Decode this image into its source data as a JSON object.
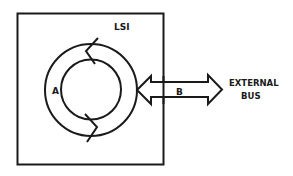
{
  "diagram": {
    "chip_label": "LSI",
    "ring_label": "A",
    "bus_arrow_label": "B",
    "external_label_line1": "EXTERNAL",
    "external_label_line2": "BUS",
    "colors": {
      "stroke": "#1a1a1a",
      "background": "#ffffff"
    }
  }
}
